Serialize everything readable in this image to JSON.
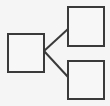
{
  "diagram": {
    "type": "tree",
    "colors": {
      "stroke": "#3a3a3a",
      "fill": "#f7f7f7",
      "background": "#f5f5f5"
    },
    "nodes": [
      {
        "id": "root",
        "label": "",
        "x": 7,
        "y": 33,
        "w": 38,
        "h": 40
      },
      {
        "id": "child-top",
        "label": "",
        "x": 67,
        "y": 6,
        "w": 38,
        "h": 41
      },
      {
        "id": "child-bottom",
        "label": "",
        "x": 67,
        "y": 60,
        "w": 38,
        "h": 40
      }
    ],
    "edges": [
      {
        "from": "root",
        "to": "child-top",
        "x1": 44,
        "y1": 51,
        "x2": 68,
        "y2": 29
      },
      {
        "from": "root",
        "to": "child-bottom",
        "x1": 44,
        "y1": 51,
        "x2": 68,
        "y2": 77
      }
    ]
  }
}
